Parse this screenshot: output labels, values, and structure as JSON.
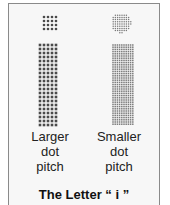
{
  "figure": {
    "left": {
      "line1": "Larger",
      "line2": "dot",
      "line3": "pitch"
    },
    "right": {
      "line1": "Smaller",
      "line2": "dot",
      "line3": "pitch"
    },
    "title": "The Letter “ i ”",
    "colors": {
      "large_dot": "#4a4a4a",
      "small_dot": "#7a7a7a",
      "frame": "#8a8a8a",
      "background": "#f7f7f7"
    }
  }
}
